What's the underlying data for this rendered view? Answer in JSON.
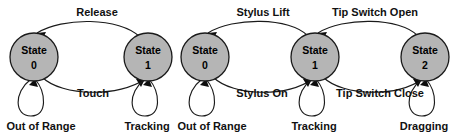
{
  "diagram": {
    "type": "state-transition-diagram",
    "title": "",
    "background_color": "#ffffff",
    "state_fill_color": "#b5b5b5",
    "state_stroke_color": "#1a1a1a",
    "label_color": "#111111",
    "machines": [
      {
        "id": "touch-state-machine",
        "states": [
          {
            "id": "s0",
            "name_line1": "State",
            "name_line2": "0",
            "cx": 34,
            "cy": 57,
            "r": 24,
            "self_loop_label": "Out of Range"
          },
          {
            "id": "s1",
            "name_line1": "State",
            "name_line2": "1",
            "cx": 148,
            "cy": 57,
            "r": 24,
            "self_loop_label": "Tracking"
          }
        ],
        "transitions": [
          {
            "id": "t-release",
            "from": "s1",
            "to": "s0",
            "label": "Release",
            "position": "top"
          },
          {
            "id": "t-touch",
            "from": "s0",
            "to": "s1",
            "label": "Touch",
            "position": "bottom"
          }
        ]
      },
      {
        "id": "stylus-state-machine",
        "states": [
          {
            "id": "s0",
            "name_line1": "State",
            "name_line2": "0",
            "cx": 205,
            "cy": 57,
            "r": 24,
            "self_loop_label": "Out of Range"
          },
          {
            "id": "s1",
            "name_line1": "State",
            "name_line2": "1",
            "cx": 315,
            "cy": 57,
            "r": 24,
            "self_loop_label": "Tracking"
          },
          {
            "id": "s2",
            "name_line1": "State",
            "name_line2": "2",
            "cx": 425,
            "cy": 57,
            "r": 24,
            "self_loop_label": "Dragging"
          }
        ],
        "transitions": [
          {
            "id": "t-stylus-lift",
            "from": "s1",
            "to": "s0",
            "label": "Stylus Lift",
            "position": "top"
          },
          {
            "id": "t-stylus-on",
            "from": "s0",
            "to": "s1",
            "label": "Stylus On",
            "position": "bottom"
          },
          {
            "id": "t-tip-switch-open",
            "from": "s2",
            "to": "s1",
            "label": "Tip Switch Open",
            "position": "top"
          },
          {
            "id": "t-tip-switch-close",
            "from": "s1",
            "to": "s2",
            "label": "Tip Switch Close",
            "position": "bottom"
          }
        ]
      }
    ],
    "labels": {
      "release": "Release",
      "touch": "Touch",
      "stylus_lift": "Stylus Lift",
      "stylus_on": "Stylus On",
      "tip_switch_open": "Tip Switch Open",
      "tip_switch_close": "Tip Switch Close",
      "out_of_range_left": "Out of Range",
      "tracking_left": "Tracking",
      "out_of_range_right": "Out of Range",
      "tracking_right": "Tracking",
      "dragging": "Dragging",
      "state_word": "State",
      "state_num_0a": "0",
      "state_num_1a": "1",
      "state_num_0b": "0",
      "state_num_1b": "1",
      "state_num_2b": "2"
    }
  }
}
